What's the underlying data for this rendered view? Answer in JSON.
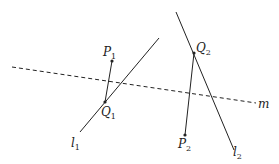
{
  "diagram": {
    "lines": {
      "m": {
        "label": "m",
        "style": "dashed",
        "from": [
          12,
          67
        ],
        "to": [
          256,
          103
        ],
        "label_pos": [
          258,
          108
        ]
      },
      "l1": {
        "label": "l",
        "subscript": "1",
        "style": "solid",
        "from": [
          80,
          132
        ],
        "to": [
          159,
          38
        ],
        "label_pos": [
          71,
          147
        ]
      },
      "l2": {
        "label": "l",
        "subscript": "2",
        "style": "solid",
        "from": [
          176,
          12
        ],
        "to": [
          234,
          150
        ],
        "label_pos": [
          233,
          156
        ]
      }
    },
    "points": {
      "P1": {
        "label": "P",
        "subscript": "1",
        "pos": [
          112,
          61
        ],
        "label_pos": [
          103,
          56
        ]
      },
      "Q1": {
        "label": "Q",
        "subscript": "1",
        "pos": [
          105,
          102
        ],
        "label_pos": [
          101,
          116
        ]
      },
      "Q2": {
        "label": "Q",
        "subscript": "2",
        "pos": [
          194,
          53
        ],
        "label_pos": [
          196,
          52
        ]
      },
      "P2": {
        "label": "P",
        "subscript": "2",
        "pos": [
          185,
          135
        ],
        "label_pos": [
          178,
          148
        ]
      }
    },
    "segments": [
      {
        "from": "P1",
        "to": "Q1"
      },
      {
        "from": "Q2",
        "to": "P2"
      }
    ],
    "colors": {
      "stroke": "#222222",
      "background": "#ffffff"
    }
  }
}
